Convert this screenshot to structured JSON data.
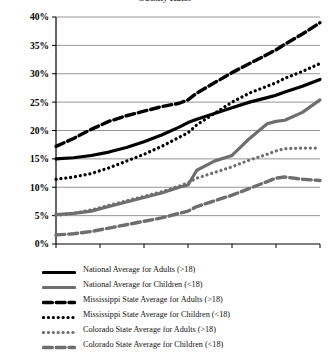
{
  "title": "Obesity Rates",
  "chart_data": {
    "type": "line",
    "title": "Obesity Rates",
    "xlabel": "",
    "ylabel": "",
    "xlim": [
      1980,
      2010
    ],
    "ylim": [
      0,
      40
    ],
    "grid": true,
    "legend_position": "bottom",
    "x_ticks": [
      "1980",
      "1985",
      "1990",
      "1995",
      "2000",
      "2005",
      "2010"
    ],
    "y_ticks": [
      "0%",
      "5%",
      "10%",
      "15%",
      "20%",
      "25%",
      "30%",
      "35%",
      "40%"
    ],
    "x": [
      1980,
      1982,
      1984,
      1986,
      1988,
      1990,
      1992,
      1994,
      1995,
      1996,
      1998,
      2000,
      2002,
      2004,
      2005,
      2006,
      2008,
      2010
    ],
    "series": [
      {
        "name": "National Average for Adults (>18)",
        "style": "solid",
        "color": "#000000",
        "width": 3.2,
        "values": [
          15.0,
          15.2,
          15.6,
          16.2,
          17.0,
          18.0,
          19.2,
          20.6,
          21.4,
          22.0,
          23.0,
          24.0,
          25.0,
          25.8,
          26.2,
          26.8,
          27.8,
          29.0
        ]
      },
      {
        "name": "National Average for Children (<18)",
        "style": "solid",
        "color": "#6e6e6e",
        "width": 3.2,
        "values": [
          5.2,
          5.4,
          5.8,
          6.6,
          7.4,
          8.2,
          9.0,
          10.0,
          10.4,
          13.0,
          14.6,
          15.6,
          18.6,
          21.2,
          21.6,
          21.8,
          23.2,
          25.4
        ]
      },
      {
        "name": "Mississippi State Average for Adults (>18)",
        "style": "dashed",
        "color": "#000000",
        "width": 3.4,
        "values": [
          17.2,
          18.6,
          20.2,
          21.6,
          22.6,
          23.4,
          24.2,
          24.8,
          25.4,
          26.6,
          28.4,
          30.2,
          31.8,
          33.4,
          34.2,
          35.2,
          37.0,
          39.0
        ]
      },
      {
        "name": "Mississippi State Average for Children (<18)",
        "style": "dotted",
        "color": "#000000",
        "width": 3.2,
        "values": [
          11.4,
          11.8,
          12.4,
          13.4,
          14.6,
          15.8,
          17.2,
          18.8,
          19.6,
          21.0,
          23.0,
          25.0,
          26.6,
          27.8,
          28.4,
          29.2,
          30.4,
          31.8
        ]
      },
      {
        "name": "Colorado State Average for Adults (>18)",
        "style": "dotted",
        "color": "#6e6e6e",
        "width": 3.2,
        "values": [
          5.0,
          5.4,
          6.0,
          6.8,
          7.6,
          8.4,
          9.2,
          10.2,
          10.8,
          11.6,
          12.6,
          13.6,
          14.8,
          15.8,
          16.4,
          16.8,
          16.9,
          16.9
        ]
      },
      {
        "name": "Colorado State Average for Children (<18)",
        "style": "dashed",
        "color": "#6e6e6e",
        "width": 3.4,
        "values": [
          1.6,
          1.8,
          2.2,
          2.8,
          3.4,
          4.0,
          4.6,
          5.4,
          5.8,
          6.6,
          7.6,
          8.6,
          9.8,
          11.0,
          11.6,
          11.8,
          11.4,
          11.2
        ]
      }
    ]
  }
}
